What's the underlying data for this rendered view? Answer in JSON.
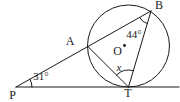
{
  "figure": {
    "colors": {
      "line": "#1a1a1a",
      "background": "#ffffff"
    },
    "points": {
      "P": "P",
      "A": "A",
      "B": "B",
      "T": "T",
      "O": "O"
    },
    "angles": {
      "at_P": "31°",
      "at_B": "44°",
      "at_T": "x"
    }
  }
}
